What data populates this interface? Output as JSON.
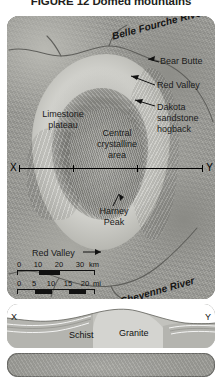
{
  "figure": {
    "title": "FIGURE 12  Domed mountains"
  },
  "map_panel": {
    "name": "black-hills-relief-map",
    "labels": {
      "belle_fourche_river": "Belle Fourche River",
      "cheyenne_river": "Cheyenne River",
      "bear_butte": "Bear Butte",
      "red_valley_northeast": "Red Valley",
      "dakota_sandstone_hogback": "Dakota sandstone hogback",
      "limestone_plateau": "Limestone plateau",
      "central_crystalline_area": "Central crystalline area",
      "harney_peak": "Harney Peak",
      "red_valley_southwest": "Red Valley"
    },
    "section_line": {
      "start_label": "X",
      "end_label": "Y"
    },
    "scale_km": {
      "ticks": [
        "0",
        "10",
        "20",
        "30"
      ],
      "unit": "km"
    },
    "scale_mi": {
      "ticks": [
        "0",
        "5",
        "10",
        "15",
        "20"
      ],
      "unit": "mi"
    }
  },
  "cross_section_panel": {
    "name": "x-y-cross-section",
    "start_label": "X",
    "end_label": "Y",
    "units": {
      "schist": "Schist",
      "granite": "Granite"
    }
  },
  "colors": {
    "panel_border": "#6e6e6a",
    "terrain_base": "#9d9d98",
    "dome_light": "#e3e3df",
    "section_rock": "#b9b9b4",
    "ink": "#111111"
  }
}
